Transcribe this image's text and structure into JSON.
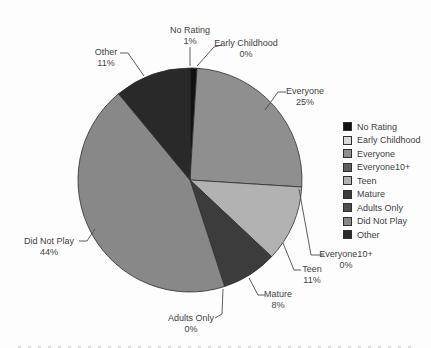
{
  "chart_data": {
    "type": "pie",
    "title": "",
    "categories": [
      "No Rating",
      "Early Childhood",
      "Everyone",
      "Everyone10+",
      "Teen",
      "Mature",
      "Adults Only",
      "Did Not Play",
      "Other"
    ],
    "values": [
      1,
      0,
      25,
      0,
      11,
      8,
      0,
      44,
      11
    ],
    "pct_labels": [
      "1%",
      "0%",
      "25%",
      "0%",
      "11%",
      "8%",
      "0%",
      "44%",
      "11%"
    ],
    "colors": [
      "#111111",
      "#d9d9d9",
      "#8f8f8f",
      "#5e5e5e",
      "#b2b2b2",
      "#3c3c3c",
      "#4c4c4c",
      "#888888",
      "#292929"
    ],
    "start_angle_deg": 0,
    "direction": "clockwise",
    "slice_border_color": "#2e2e2e",
    "leader_line_color": "#4a4a4a",
    "label_text_color": "#3f3f3f",
    "legend": {
      "position": "right",
      "entries": [
        "No Rating",
        "Early Childhood",
        "Everyone",
        "Everyone10+",
        "Teen",
        "Mature",
        "Adults Only",
        "Did Not Play",
        "Other"
      ]
    }
  }
}
